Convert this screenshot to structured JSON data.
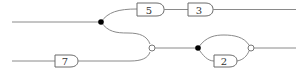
{
  "diagram": {
    "type": "circuit-flow",
    "gates": [
      {
        "id": "g5",
        "label": "5"
      },
      {
        "id": "g3",
        "label": "3"
      },
      {
        "id": "g7",
        "label": "7"
      },
      {
        "id": "g2",
        "label": "2"
      }
    ],
    "nodes": [
      {
        "id": "split-top",
        "kind": "filled-junction"
      },
      {
        "id": "merge-mid",
        "kind": "hollow-junction"
      },
      {
        "id": "split-right",
        "kind": "filled-junction"
      },
      {
        "id": "merge-right",
        "kind": "hollow-junction"
      }
    ],
    "edges": [
      [
        "input-top",
        "split-top"
      ],
      [
        "split-top",
        "g5"
      ],
      [
        "g5",
        "g3"
      ],
      [
        "g3",
        "output-top"
      ],
      [
        "split-top",
        "merge-mid"
      ],
      [
        "input-bottom",
        "g7"
      ],
      [
        "g7",
        "merge-mid"
      ],
      [
        "merge-mid",
        "split-right"
      ],
      [
        "split-right",
        "merge-right"
      ],
      [
        "split-right",
        "g2"
      ],
      [
        "g2",
        "merge-right"
      ],
      [
        "merge-right",
        "output-right"
      ]
    ],
    "colors": {
      "wire": "#8a8a8a",
      "gate_stroke": "#6a6a6a",
      "junction": "#000000"
    }
  }
}
